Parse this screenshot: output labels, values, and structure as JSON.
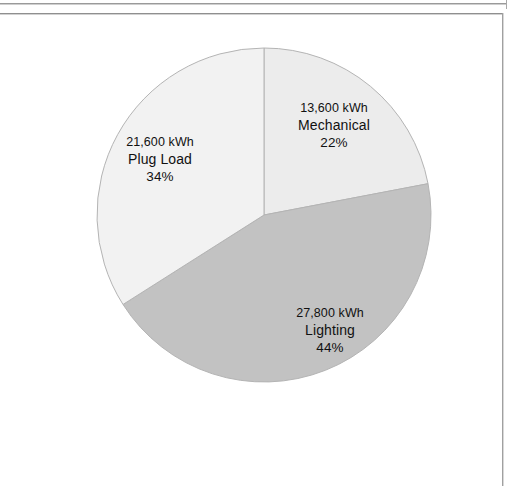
{
  "page": {
    "background_color": "#ffffff",
    "frame_line_color": "#9a9a9a"
  },
  "chart_data": {
    "type": "pie",
    "title": "",
    "subtitle": "",
    "xlabel": "",
    "ylabel": "",
    "legend_position": "none",
    "grid": false,
    "units": "kWh",
    "total_value": 63000,
    "start_angle_deg": 0,
    "direction": "clockwise",
    "categories": [
      "Mechanical",
      "Lighting",
      "Plug Load"
    ],
    "values": [
      13600,
      27800,
      21600
    ],
    "percentages": [
      22,
      44,
      34
    ],
    "colors": [
      "#ececec",
      "#c2c2c2",
      "#f2f2f2"
    ],
    "slices": [
      {
        "name": "Mechanical",
        "value": 13600,
        "value_label": "13,600 kWh",
        "percent": 22,
        "percent_label": "22%",
        "color": "#ececec",
        "start_deg": 0,
        "end_deg": 79.2
      },
      {
        "name": "Lighting",
        "value": 27800,
        "value_label": "27,800 kWh",
        "percent": 44,
        "percent_label": "44%",
        "color": "#c2c2c2",
        "start_deg": 79.2,
        "end_deg": 237.6
      },
      {
        "name": "Plug Load",
        "value": 21600,
        "value_label": "21,600 kWh",
        "percent": 34,
        "percent_label": "34%",
        "color": "#f2f2f2",
        "start_deg": 237.6,
        "end_deg": 360
      }
    ]
  },
  "labels": {
    "mechanical": {
      "value": "13,600 kWh",
      "name": "Mechanical",
      "percent": "22%"
    },
    "lighting": {
      "value": "27,800 kWh",
      "name": "Lighting",
      "percent": "44%"
    },
    "plug_load": {
      "value": "21,600 kWh",
      "name": "Plug Load",
      "percent": "34%"
    }
  }
}
